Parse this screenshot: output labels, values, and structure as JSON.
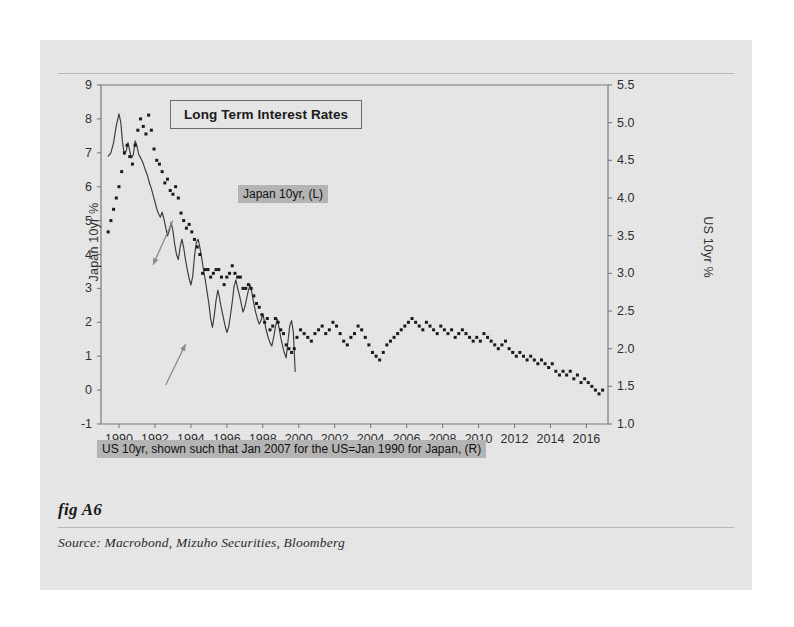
{
  "figure": {
    "fig_label": "fig A6",
    "source": "Source:  Macrobond, Mizuho Securities, Bloomberg"
  },
  "chart_data": {
    "type": "line",
    "title": "Long Term Interest Rates",
    "xlabel": "",
    "ylabel": "Japan 10yr %",
    "y2label": "US 10yr %",
    "grid": false,
    "legend_position": "inline-callouts",
    "xlim": [
      1989.0,
      2017.2
    ],
    "ylim": [
      -1,
      9
    ],
    "y2lim": [
      1.0,
      5.5
    ],
    "xticks": [
      1990,
      1992,
      1994,
      1996,
      1998,
      2000,
      2002,
      2004,
      2006,
      2008,
      2010,
      2012,
      2014,
      2016
    ],
    "xticklabels": [
      "1990",
      "1992",
      "1994",
      "1996",
      "1998",
      "2000",
      "2002",
      "2004",
      "2006",
      "2008",
      "2010",
      "2012",
      "2014",
      "2016"
    ],
    "yticks": [
      -1,
      0,
      1,
      2,
      3,
      4,
      5,
      6,
      7,
      8,
      9
    ],
    "yticklabels": [
      "-1",
      "0",
      "1",
      "2",
      "3",
      "4",
      "5",
      "6",
      "7",
      "8",
      "9"
    ],
    "y2ticks": [
      1.0,
      1.5,
      2.0,
      2.5,
      3.0,
      3.5,
      4.0,
      4.5,
      5.0,
      5.5
    ],
    "y2ticklabels": [
      "1.0",
      "1.5",
      "2.0",
      "2.5",
      "3.0",
      "3.5",
      "4.0",
      "4.5",
      "5.0",
      "5.5"
    ],
    "annotations": [
      {
        "name": "japan-callout",
        "text": "Japan 10yr, (L)",
        "arrow_from_x": 1993.0,
        "arrow_from_y": 5.0,
        "arrow_to_x": 1991.9,
        "arrow_to_y": 3.7
      },
      {
        "name": "us-callout",
        "text": "US 10yr, shown such that Jan 2007 for the US=Jan 1990 for Japan, (R)",
        "arrow_from_x": 1992.6,
        "arrow_from_y": 0.15,
        "arrow_to_x": 1993.7,
        "arrow_to_y": 1.35
      }
    ],
    "series": [
      {
        "name": "Japan 10yr, (L)",
        "axis": "left",
        "style": "solid-line",
        "color": "#3a3a3a",
        "x": [
          1989.4,
          1989.55,
          1989.7,
          1989.85,
          1990.0,
          1990.1,
          1990.2,
          1990.3,
          1990.4,
          1990.5,
          1990.6,
          1990.7,
          1990.8,
          1990.9,
          1991.0,
          1991.1,
          1991.2,
          1991.3,
          1991.4,
          1991.5,
          1991.6,
          1991.7,
          1991.8,
          1991.9,
          1992.0,
          1992.1,
          1992.2,
          1992.3,
          1992.4,
          1992.5,
          1992.6,
          1992.7,
          1992.8,
          1992.9,
          1993.0,
          1993.1,
          1993.2,
          1993.3,
          1993.4,
          1993.5,
          1993.6,
          1993.7,
          1993.8,
          1993.9,
          1994.0,
          1994.1,
          1994.2,
          1994.3,
          1994.4,
          1994.5,
          1994.6,
          1994.7,
          1994.8,
          1994.9,
          1995.0,
          1995.1,
          1995.2,
          1995.3,
          1995.4,
          1995.5,
          1995.6,
          1995.7,
          1995.8,
          1995.9,
          1996.0,
          1996.1,
          1996.2,
          1996.3,
          1996.4,
          1996.5,
          1996.6,
          1996.7,
          1996.8,
          1996.9,
          1997.0,
          1997.1,
          1997.2,
          1997.3,
          1997.4,
          1997.5,
          1997.6,
          1997.7,
          1997.8,
          1997.9,
          1998.0,
          1998.1,
          1998.2,
          1998.3,
          1998.4,
          1998.5,
          1998.6,
          1998.7,
          1998.8,
          1998.9,
          1999.0,
          1999.1,
          1999.2,
          1999.3,
          1999.4,
          1999.5,
          1999.6,
          1999.7,
          1999.8
        ],
        "y": [
          6.9,
          7.0,
          7.3,
          7.8,
          8.15,
          7.9,
          7.3,
          6.95,
          7.05,
          7.3,
          7.05,
          6.85,
          6.95,
          7.35,
          7.2,
          6.95,
          6.85,
          6.75,
          6.6,
          6.45,
          6.3,
          6.1,
          5.95,
          5.75,
          5.55,
          5.35,
          5.2,
          5.1,
          5.25,
          5.05,
          4.8,
          4.55,
          4.7,
          4.95,
          4.7,
          4.3,
          4.0,
          3.85,
          4.2,
          4.45,
          4.2,
          3.85,
          3.55,
          3.3,
          3.1,
          3.35,
          3.95,
          4.35,
          4.45,
          4.2,
          3.9,
          3.55,
          3.25,
          2.9,
          2.55,
          2.1,
          1.85,
          2.2,
          2.65,
          2.95,
          2.7,
          2.4,
          2.15,
          1.9,
          1.7,
          1.85,
          2.2,
          2.6,
          3.05,
          3.25,
          3.0,
          2.8,
          2.55,
          2.3,
          2.45,
          2.7,
          2.95,
          3.1,
          2.85,
          2.55,
          2.3,
          2.1,
          1.95,
          2.05,
          2.25,
          2.0,
          1.75,
          1.55,
          1.4,
          1.3,
          1.55,
          1.85,
          2.1,
          1.85,
          1.55,
          1.3,
          1.1,
          0.95,
          1.45,
          1.9,
          2.05,
          1.7,
          0.55
        ]
      },
      {
        "name": "US 10yr, (R)",
        "axis": "right",
        "style": "dotted-markers",
        "color": "#1a1a1a",
        "x": [
          1989.4,
          1989.55,
          1989.7,
          1989.85,
          1990.0,
          1990.15,
          1990.3,
          1990.45,
          1990.6,
          1990.75,
          1990.9,
          1991.05,
          1991.2,
          1991.35,
          1991.5,
          1991.65,
          1991.8,
          1991.95,
          1992.1,
          1992.25,
          1992.4,
          1992.55,
          1992.7,
          1992.85,
          1993.0,
          1993.15,
          1993.3,
          1993.45,
          1993.6,
          1993.75,
          1993.9,
          1994.05,
          1994.2,
          1994.35,
          1994.5,
          1994.65,
          1994.8,
          1994.95,
          1995.1,
          1995.25,
          1995.4,
          1995.55,
          1995.7,
          1995.85,
          1996.0,
          1996.15,
          1996.3,
          1996.45,
          1996.6,
          1996.75,
          1996.9,
          1997.05,
          1997.2,
          1997.35,
          1997.5,
          1997.65,
          1997.8,
          1997.95,
          1998.1,
          1998.25,
          1998.4,
          1998.55,
          1998.7,
          1998.85,
          1999.0,
          1999.15,
          1999.3,
          1999.45,
          1999.6,
          1999.75,
          1999.9,
          2000.1,
          2000.3,
          2000.5,
          2000.7,
          2000.9,
          2001.1,
          2001.3,
          2001.5,
          2001.7,
          2001.9,
          2002.1,
          2002.3,
          2002.5,
          2002.7,
          2002.9,
          2003.1,
          2003.3,
          2003.5,
          2003.7,
          2003.9,
          2004.1,
          2004.3,
          2004.5,
          2004.7,
          2004.9,
          2005.1,
          2005.3,
          2005.5,
          2005.7,
          2005.9,
          2006.1,
          2006.3,
          2006.5,
          2006.7,
          2006.9,
          2007.1,
          2007.3,
          2007.5,
          2007.7,
          2007.9,
          2008.1,
          2008.3,
          2008.5,
          2008.7,
          2008.9,
          2009.1,
          2009.3,
          2009.5,
          2009.7,
          2009.9,
          2010.1,
          2010.3,
          2010.5,
          2010.7,
          2010.9,
          2011.1,
          2011.3,
          2011.5,
          2011.7,
          2011.9,
          2012.1,
          2012.3,
          2012.5,
          2012.7,
          2012.9,
          2013.1,
          2013.3,
          2013.5,
          2013.7,
          2013.9,
          2014.1,
          2014.3,
          2014.5,
          2014.7,
          2014.9,
          2015.1,
          2015.3,
          2015.5,
          2015.7,
          2015.9,
          2016.1,
          2016.3,
          2016.5,
          2016.7,
          2016.9
        ],
        "y": [
          3.55,
          3.7,
          3.85,
          4.0,
          4.15,
          4.35,
          4.6,
          4.7,
          4.55,
          4.45,
          4.7,
          4.9,
          5.05,
          4.95,
          4.85,
          5.1,
          4.9,
          4.65,
          4.5,
          4.45,
          4.35,
          4.2,
          4.25,
          4.1,
          4.05,
          4.15,
          4.0,
          3.8,
          3.7,
          3.6,
          3.65,
          3.55,
          3.45,
          3.35,
          3.25,
          3.0,
          3.05,
          3.05,
          2.95,
          3.0,
          3.05,
          3.05,
          2.95,
          2.85,
          2.95,
          3.0,
          3.1,
          3.0,
          2.95,
          2.95,
          2.8,
          2.8,
          2.85,
          2.8,
          2.7,
          2.6,
          2.55,
          2.45,
          2.35,
          2.4,
          2.25,
          2.3,
          2.4,
          2.35,
          2.25,
          2.2,
          2.05,
          2.0,
          1.95,
          2.0,
          2.15,
          2.25,
          2.2,
          2.15,
          2.1,
          2.2,
          2.25,
          2.3,
          2.2,
          2.25,
          2.35,
          2.3,
          2.2,
          2.1,
          2.05,
          2.15,
          2.2,
          2.3,
          2.25,
          2.15,
          2.05,
          1.95,
          1.9,
          1.85,
          1.95,
          2.05,
          2.1,
          2.15,
          2.2,
          2.25,
          2.3,
          2.35,
          2.4,
          2.35,
          2.3,
          2.25,
          2.35,
          2.3,
          2.25,
          2.2,
          2.3,
          2.25,
          2.2,
          2.25,
          2.15,
          2.2,
          2.25,
          2.2,
          2.15,
          2.1,
          2.15,
          2.1,
          2.2,
          2.15,
          2.1,
          2.05,
          2.0,
          2.05,
          2.1,
          2.0,
          1.95,
          1.9,
          1.95,
          1.9,
          1.85,
          1.9,
          1.85,
          1.8,
          1.85,
          1.8,
          1.75,
          1.8,
          1.7,
          1.65,
          1.7,
          1.65,
          1.7,
          1.6,
          1.65,
          1.55,
          1.6,
          1.55,
          1.5,
          1.45,
          1.4,
          1.45
        ]
      }
    ]
  }
}
